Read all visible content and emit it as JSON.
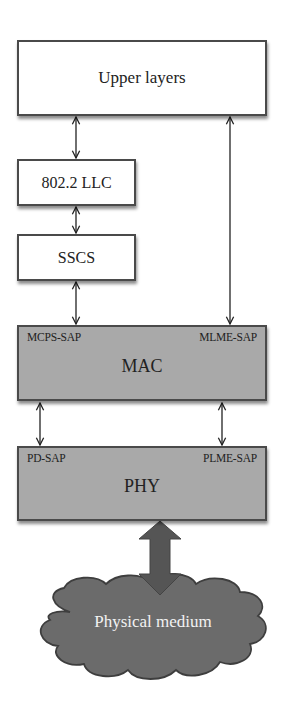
{
  "diagram": {
    "layers": {
      "upper": {
        "label": "Upper layers"
      },
      "llc": {
        "label": "802.2 LLC"
      },
      "sscs": {
        "label": "SSCS"
      },
      "mac": {
        "label": "MAC",
        "sap_left": "MCPS-SAP",
        "sap_right": "MLME-SAP"
      },
      "phy": {
        "label": "PHY",
        "sap_left": "PD-SAP",
        "sap_right": "PLME-SAP"
      },
      "medium": {
        "label": "Physical medium"
      }
    },
    "connections": [
      {
        "from": "Upper layers",
        "to": "802.2 LLC",
        "type": "bidirectional"
      },
      {
        "from": "802.2 LLC",
        "to": "SSCS",
        "type": "bidirectional"
      },
      {
        "from": "SSCS",
        "to": "MCPS-SAP",
        "type": "bidirectional"
      },
      {
        "from": "Upper layers",
        "to": "MLME-SAP",
        "type": "bidirectional"
      },
      {
        "from": "MAC",
        "to": "PD-SAP",
        "type": "bidirectional"
      },
      {
        "from": "MAC",
        "to": "PLME-SAP",
        "type": "bidirectional"
      },
      {
        "from": "PHY",
        "to": "Physical medium",
        "type": "bidirectional-thick"
      }
    ],
    "colors": {
      "box_border": "#4a4a4a",
      "white_fill": "#ffffff",
      "gray_fill": "#a9a9a9",
      "cloud_fill": "#6b6b6b",
      "thick_arrow": "#555555"
    }
  }
}
